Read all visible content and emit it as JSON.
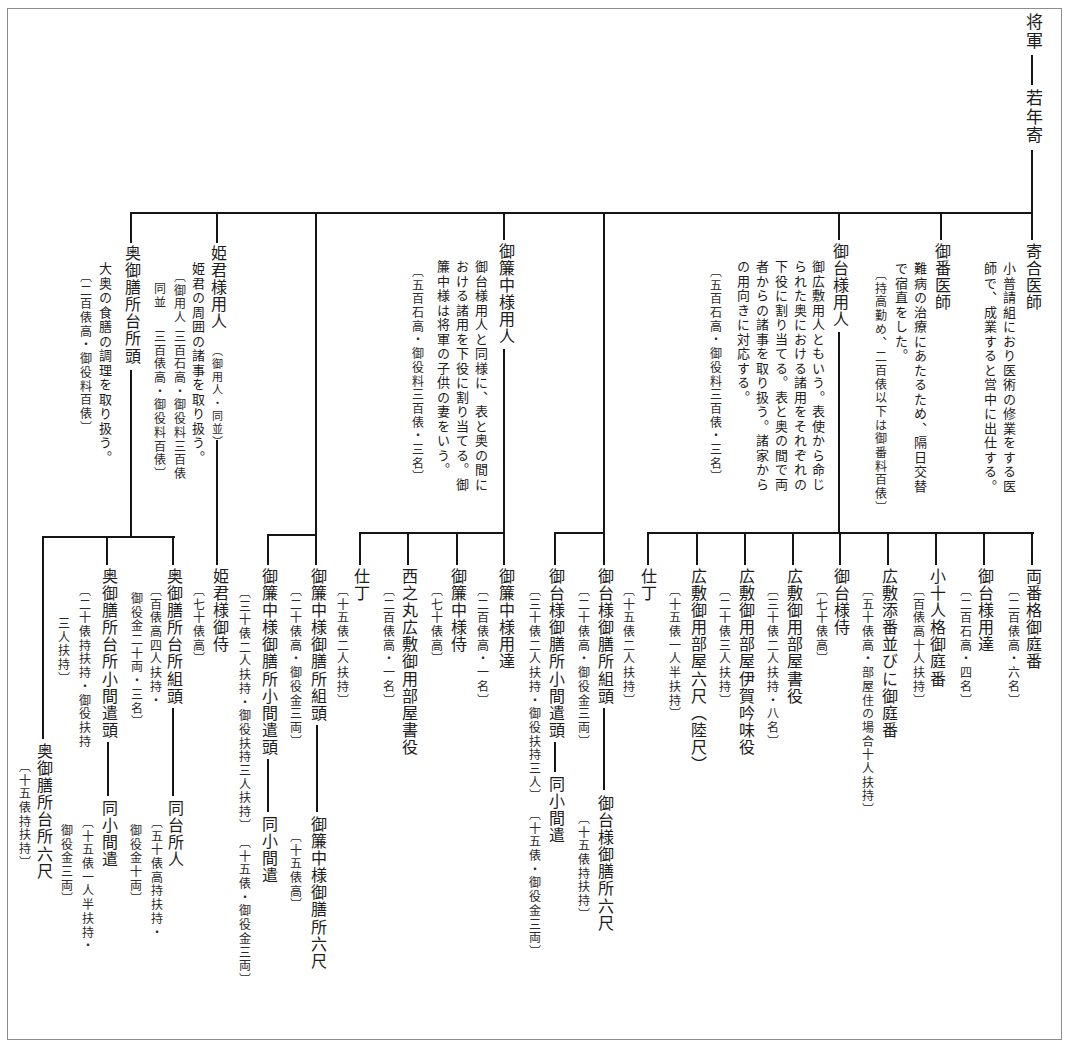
{
  "root": {
    "title": "将軍",
    "child_title": "若年寄"
  },
  "branches": [
    {
      "title": "寄合医師",
      "desc": [
        "小普請組におり医術の修業をする医",
        "師で、成業すると営中に出仕する。"
      ]
    },
    {
      "title": "御番医師",
      "desc": [
        "難病の治療にあたるため、隔日交替",
        "で宿直をした。"
      ],
      "note": "〔持高勤め、二百俵以下は御番料百俵〕"
    },
    {
      "title": "御台様用人",
      "desc": [
        "御広敷用人ともいう。表使から命じ",
        "られた奥における諸用をそれぞれの",
        "下役に割り当てる。表と奥の間で両",
        "者からの諸事を取り扱う。諸家から",
        "の用向きに対応する。"
      ],
      "note": "〔五百石高・御役料三百俵・三名〕",
      "children": [
        {
          "title": "両番格御庭番",
          "note": "〔二百俵高・六名〕"
        },
        {
          "title": "御台様用達",
          "note": "〔二百石高・四名〕"
        },
        {
          "title": "小十人格御庭番",
          "note": "〔百俵高十人扶持〕"
        },
        {
          "title": "広敷添番並びに御庭番",
          "note": "〔五十俵高・部屋住の場合十人扶持〕"
        },
        {
          "title": "御台様侍",
          "note": "〔七十俵高〕"
        },
        {
          "title": "広敷御用部屋書役",
          "note": "〔三十俵二人扶持・八名〕"
        },
        {
          "title": "広敷御用部屋伊賀吟味役",
          "note": "〔二十俵三人扶持〕"
        },
        {
          "title": "広敷御用部屋六尺（陸尺）",
          "note": "〔十五俵一人半扶持〕"
        },
        {
          "title": "仕丁",
          "note": "〔十五俵二人扶持〕"
        }
      ]
    },
    {
      "children": [
        {
          "title": "御台様御膳所組頭",
          "note": "〔二十俵高・御役金三両〕",
          "next": {
            "title": "御台様御膳所六尺",
            "note": "〔十五俵持扶持〕"
          }
        },
        {
          "title": "御台様御膳所小間遣頭",
          "note": "〔三十俵二人扶持・御役扶持三人〕",
          "next": {
            "title": "同小間遣",
            "note": "〔十五俵・御役金三両〕"
          }
        }
      ]
    },
    {
      "title": "御簾中様用人",
      "desc": [
        "御台様用人と同様に、表と奥の間に",
        "おける諸用を下役に割り当てる。御",
        "簾中様は将軍の子供の妻をいう。"
      ],
      "note": "〔五百石高・御役料三百俵・三名〕",
      "children": [
        {
          "title": "御簾中様用達",
          "note": "〔二百俵高・一名〕"
        },
        {
          "title": "御簾中様侍",
          "note": "〔七十俵高〕"
        },
        {
          "title": "西之丸広敷御用部屋書役",
          "note": "〔二百俵高・一名〕"
        },
        {
          "title": "仕丁",
          "note": "〔十五俵二人扶持〕"
        }
      ]
    },
    {
      "children": [
        {
          "title": "御簾中様御膳所組頭",
          "note": "〔二十俵高・御役金三両〕",
          "next": {
            "title": "御簾中様御膳所六尺",
            "note": "〔十五俵高〕"
          }
        },
        {
          "title": "御簾中様御膳所小間遣頭",
          "note": "〔三十俵二人扶持・御役扶持三人扶持〕",
          "next": {
            "title": "同小間遣",
            "note": "〔十五俵・御役金三両〕"
          }
        }
      ]
    },
    {
      "title": "姫君様用人",
      "subtitle": "（御用人・同並）",
      "desc": [
        "姫君の周囲の諸事を取り扱う。"
      ],
      "note_rows": [
        {
          "label": "〔御用人",
          "value": "三百石高・御役料三百俵"
        },
        {
          "label": "同並",
          "value": "三百俵高・御役料百俵〕"
        }
      ],
      "children": [
        {
          "title": "姫君様御侍",
          "note": "〔七十俵高〕"
        }
      ]
    },
    {
      "title": "奥御膳所台所頭",
      "desc": [
        "大奥の食膳の調理を取り扱う。"
      ],
      "note": "〔二百俵高・御役料百俵〕",
      "children": [
        {
          "title": "奥御膳所台所組頭",
          "note_lines": [
            "〔百俵高四人扶持・",
            "御役金二十両・三名〕"
          ],
          "next": {
            "title": "同台所人",
            "note_lines": [
              "〔五十俵高持扶持・",
              "御役金十両〕"
            ]
          }
        },
        {
          "title": "奥御膳所台所小間遣頭",
          "note_lines": [
            "〔二十俵持扶持・御役扶持",
            "三人扶持〕"
          ],
          "next": {
            "title": "同小間遣",
            "note_lines": [
              "〔十五俵一人半扶持・",
              "御役金三両〕"
            ]
          }
        },
        {
          "title": "奥御膳所台所六尺",
          "note": "〔十五俵持扶持〕"
        }
      ]
    }
  ]
}
